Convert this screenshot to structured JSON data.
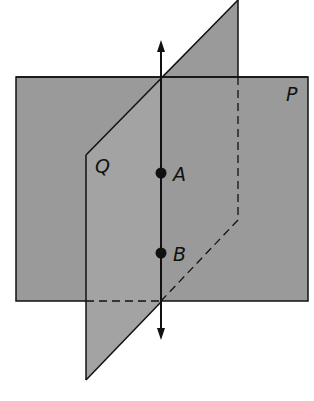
{
  "diagram": {
    "colors": {
      "plane_fill": "#9a9a9a",
      "stroke": "#111111",
      "background": "#ffffff"
    },
    "planes": [
      {
        "id": "P",
        "label": "P"
      },
      {
        "id": "Q",
        "label": "Q"
      }
    ],
    "points": [
      {
        "id": "A",
        "label": "A"
      },
      {
        "id": "B",
        "label": "B"
      }
    ],
    "line": {
      "label": "intersection line AB",
      "arrows": "both ends"
    }
  }
}
